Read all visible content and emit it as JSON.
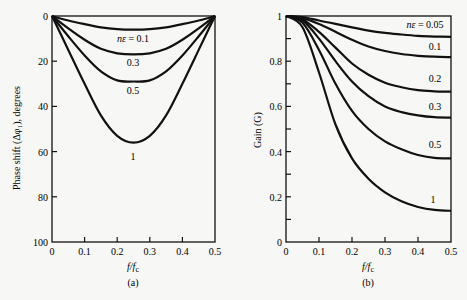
{
  "chart_data": [
    {
      "type": "line",
      "panel": "(a)",
      "title": "",
      "xlabel": "f/fc",
      "ylabel": "Phase shift (Δφ₁), degrees",
      "xlim": [
        0,
        0.5
      ],
      "ylim": [
        100,
        0
      ],
      "y_inverted": true,
      "xticks": [
        "0",
        "0.1",
        "0.2",
        "0.3",
        "0.4",
        "0.5"
      ],
      "yticks": [
        "0",
        "20",
        "40",
        "60",
        "80",
        "100"
      ],
      "grid": false,
      "x": [
        0,
        0.05,
        0.1,
        0.15,
        0.2,
        0.25,
        0.3,
        0.35,
        0.4,
        0.45,
        0.5
      ],
      "series": [
        {
          "name": "nε = 0.1",
          "label": "nε = 0.1",
          "values": [
            0,
            2,
            3.6,
            5,
            5.8,
            6,
            5.8,
            5,
            3.6,
            2,
            0
          ]
        },
        {
          "name": "0.3",
          "label": "0.3",
          "values": [
            0,
            5.5,
            10.5,
            14.5,
            16.5,
            17,
            16.5,
            14.5,
            10.5,
            5.5,
            0
          ]
        },
        {
          "name": "0.5",
          "label": "0.5",
          "values": [
            0,
            9,
            17.5,
            24.5,
            28.5,
            29,
            28.5,
            24.5,
            17.5,
            9,
            0
          ]
        },
        {
          "name": "1",
          "label": "1",
          "values": [
            0,
            15,
            30,
            44,
            53,
            56,
            53,
            44,
            30,
            15,
            0
          ]
        }
      ]
    },
    {
      "type": "line",
      "panel": "(b)",
      "title": "",
      "xlabel": "f/fc",
      "ylabel": "Gain (G)",
      "xlim": [
        0,
        0.5
      ],
      "ylim": [
        0,
        1
      ],
      "xticks": [
        "0",
        "0.1",
        "0.2",
        "0.3",
        "0.4",
        "0.5"
      ],
      "yticks": [
        "0",
        "0.2",
        "0.4",
        "0.6",
        "0.8",
        "1"
      ],
      "grid": false,
      "x": [
        0,
        0.05,
        0.1,
        0.15,
        0.2,
        0.25,
        0.3,
        0.35,
        0.4,
        0.45,
        0.5
      ],
      "series": [
        {
          "name": "nε = 0.05",
          "label": "nε = 0.05",
          "values": [
            1,
            0.995,
            0.98,
            0.965,
            0.95,
            0.935,
            0.925,
            0.918,
            0.912,
            0.909,
            0.908
          ]
        },
        {
          "name": "0.1",
          "label": "0.1",
          "values": [
            1,
            0.99,
            0.965,
            0.93,
            0.895,
            0.865,
            0.845,
            0.832,
            0.824,
            0.82,
            0.818
          ]
        },
        {
          "name": "0.2",
          "label": "0.2",
          "values": [
            1,
            0.985,
            0.93,
            0.86,
            0.79,
            0.74,
            0.705,
            0.685,
            0.672,
            0.667,
            0.665
          ]
        },
        {
          "name": "0.3",
          "label": "0.3",
          "values": [
            1,
            0.98,
            0.9,
            0.8,
            0.71,
            0.645,
            0.6,
            0.575,
            0.56,
            0.552,
            0.55
          ]
        },
        {
          "name": "0.5",
          "label": "0.5",
          "values": [
            1,
            0.97,
            0.85,
            0.7,
            0.58,
            0.5,
            0.445,
            0.41,
            0.385,
            0.372,
            0.37
          ]
        },
        {
          "name": "1",
          "label": "1",
          "values": [
            1,
            0.95,
            0.75,
            0.52,
            0.37,
            0.28,
            0.22,
            0.18,
            0.155,
            0.142,
            0.138
          ]
        }
      ]
    }
  ],
  "labels": {
    "panel_a": "(a)",
    "panel_b": "(b)",
    "xlabel_a": "f/fc",
    "xlabel_b": "f/fc",
    "ylabel_a": "Phase shift (Δφ₁), degrees",
    "ylabel_b": "Gain (G)"
  }
}
